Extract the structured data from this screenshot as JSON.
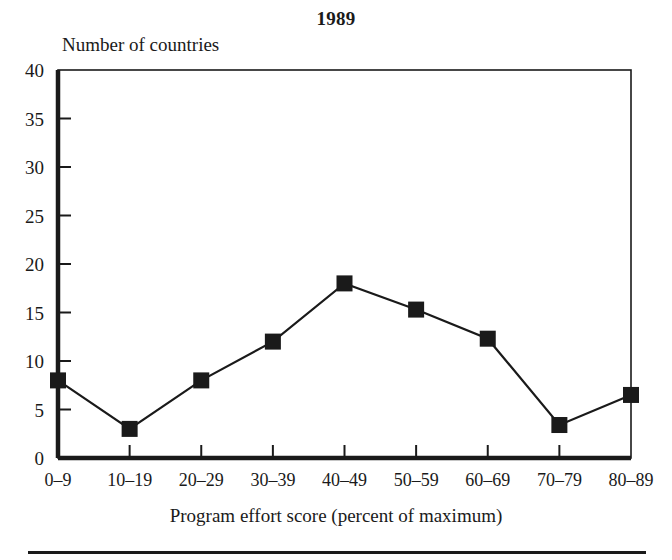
{
  "figure": {
    "title": "1989",
    "y_axis_caption": "Number of countries",
    "x_axis_caption": "Program effort score (percent of maximum)"
  },
  "chart_data": {
    "type": "line",
    "title": "1989",
    "xlabel": "Program effort score (percent of maximum)",
    "ylabel": "Number of countries",
    "categories": [
      "0–9",
      "10–19",
      "20–29",
      "30–39",
      "40–49",
      "50–59",
      "60–69",
      "70–79",
      "80–89"
    ],
    "values": [
      8,
      3,
      8,
      12,
      18,
      15.3,
      12.3,
      3.4,
      6.5
    ],
    "ylim": [
      0,
      40
    ],
    "ytick_labels": [
      "0",
      "5",
      "10",
      "15",
      "20",
      "25",
      "30",
      "35",
      "40"
    ],
    "ytick_values": [
      0,
      5,
      10,
      15,
      20,
      25,
      30,
      35,
      40
    ],
    "grid": false,
    "legend": "none",
    "marker": "filled-square",
    "line_color": "#1a1a1a",
    "marker_color": "#1a1a1a"
  }
}
